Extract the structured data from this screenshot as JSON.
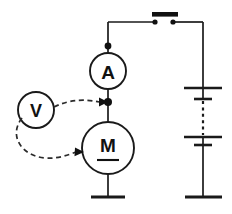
{
  "diagram": {
    "background_color": "#ffffff",
    "line_color": "#1a1a1a"
  },
  "components": {
    "ammeter": {
      "label": "A",
      "name": "ammeter",
      "cx": 108,
      "cy": 71,
      "r": 18
    },
    "motor": {
      "label": "M",
      "name": "motor",
      "cx": 108,
      "cy": 148,
      "r": 26,
      "underlined": "true"
    },
    "voltmeter": {
      "label": "V",
      "name": "voltmeter",
      "cx": 36,
      "cy": 110,
      "r": 18
    },
    "switch": {
      "name": "switch",
      "state": "closed",
      "bar_x1": 152,
      "bar_x2": 178,
      "bar_y": 14,
      "contact_left_x": 155,
      "contact_right_x": 173,
      "contact_y": 22
    },
    "battery": {
      "name": "battery",
      "plate_long_half_width": 19,
      "plate_short_half_width": 9,
      "cells": [
        {
          "long_y": 88,
          "short_y": 99
        },
        {
          "long_y": 137,
          "short_y": 145
        }
      ],
      "dash_from_y": 100,
      "dash_to_y": 136,
      "center_x": 203,
      "bottom_terminal_y": 197
    }
  },
  "nodes": [
    {
      "name": "junction-top-ammeter",
      "x": 108,
      "y": 46
    },
    {
      "name": "junction-ammeter-motor",
      "x": 108,
      "y": 102
    }
  ],
  "leads": [
    {
      "name": "voltmeter-lead-upper",
      "style": "dashed",
      "arrow_to": "junction-ammeter-motor"
    },
    {
      "name": "voltmeter-lead-lower",
      "style": "dashed",
      "arrow_to": "motor-left-terminal"
    }
  ],
  "terminals": {
    "motor_bottom_bar_y": 197,
    "motor_bottom_bar_half_width": 17
  }
}
